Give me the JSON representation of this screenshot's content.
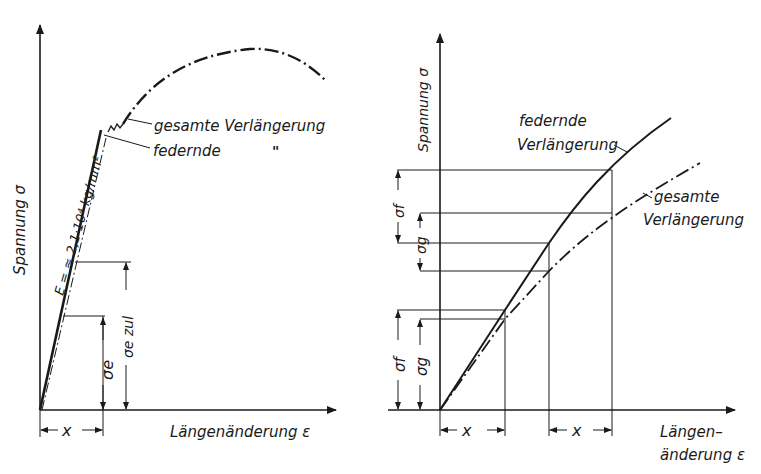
{
  "left_diagram": {
    "y_axis_label": "Spannung σ",
    "x_axis_label": "Längenänderung ε",
    "modulus_label": "E = ≈ 2,1·10⁴ kg/mm²",
    "curve_label_total": "gesamte Verlängerung",
    "curve_label_elastic": "federnde",
    "ditto_mark": "\"",
    "sigma_e_label": "σe",
    "sigma_e_zul_label": "σe zul",
    "x_dim_label": "x"
  },
  "right_diagram": {
    "y_axis_label": "Spannung σ",
    "x_axis_label_line1": "Längen–",
    "x_axis_label_line2": "änderung ε",
    "elastic_label_line1": "federnde",
    "elastic_label_line2": "Verlängerung",
    "total_label_line1": "gesamte",
    "total_label_line2": "Verlängerung",
    "sigma_f_upper": "σf",
    "sigma_g_upper": "σg",
    "sigma_f_lower": "σf",
    "sigma_g_lower": "σg",
    "x_dim_left": "x",
    "x_dim_right": "x"
  }
}
